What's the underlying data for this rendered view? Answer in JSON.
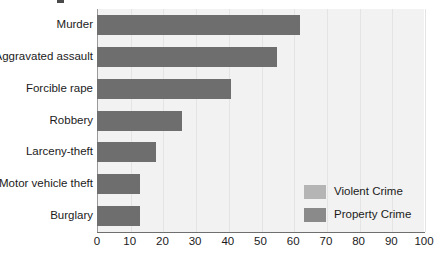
{
  "chart_data": {
    "type": "bar",
    "orientation": "horizontal",
    "title": "",
    "xlabel": "",
    "ylabel": "",
    "xlim": [
      0,
      100
    ],
    "xticks": [
      "0",
      "10",
      "20",
      "30",
      "40",
      "50",
      "60",
      "70",
      "80",
      "90",
      "100"
    ],
    "grid": true,
    "legend_position": "inside-bottom-right",
    "categories": [
      "Murder",
      "Aggravated assault",
      "Forcible rape",
      "Robbery",
      "Larceny-theft",
      "Motor vehicle theft",
      "Burglary"
    ],
    "values": [
      62,
      55,
      41,
      26,
      18,
      13,
      13
    ],
    "bar_groups": [
      "Violent Crime",
      "Violent Crime",
      "Violent Crime",
      "Violent Crime",
      "Property Crime",
      "Property Crime",
      "Property Crime"
    ],
    "legend": [
      {
        "label": "Violent Crime",
        "color": "#b5b5b5"
      },
      {
        "label": "Property Crime",
        "color": "#8a8a8a"
      }
    ],
    "colors": {
      "bar": "#6e6e6e",
      "plot_background": "#f2f2f2",
      "gridline": "#e4e4e4",
      "axis": "#6f6f6f",
      "text": "#1b1b1b"
    }
  }
}
